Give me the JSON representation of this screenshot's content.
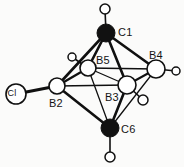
{
  "figure": {
    "kind": "molecular-structure-diagram",
    "background_color": "#fbfbfa",
    "line_color": "#101010",
    "cage_atom_fill": "#ffffff",
    "carbon_atom_fill": "#111111",
    "width": 184,
    "height": 167
  },
  "atoms": [
    {
      "id": "C1",
      "label": "C1",
      "element": "C",
      "style": "filled",
      "x": 106,
      "y": 33,
      "r": 9,
      "label_x": 118,
      "label_y": 27
    },
    {
      "id": "B4",
      "label": "B4",
      "element": "B",
      "style": "open",
      "x": 156,
      "y": 69,
      "r": 9,
      "label_x": 149,
      "label_y": 50
    },
    {
      "id": "B5",
      "label": "B5",
      "element": "B",
      "style": "open",
      "x": 88,
      "y": 68,
      "r": 8,
      "label_x": 96,
      "label_y": 55
    },
    {
      "id": "B2",
      "label": "B2",
      "element": "B",
      "style": "open",
      "x": 57,
      "y": 86,
      "r": 8,
      "label_x": 49,
      "label_y": 98
    },
    {
      "id": "B3",
      "label": "B3",
      "element": "B",
      "style": "open",
      "x": 127,
      "y": 85,
      "r": 9,
      "label_x": 105,
      "label_y": 92
    },
    {
      "id": "C6",
      "label": "C6",
      "element": "C",
      "style": "filled",
      "x": 110,
      "y": 128,
      "r": 9,
      "label_x": 121,
      "label_y": 124
    },
    {
      "id": "Cl",
      "label": "Cl",
      "element": "Cl",
      "style": "open-labeled",
      "x": 16,
      "y": 94,
      "r": 10,
      "label_x": 9,
      "label_y": 90
    }
  ],
  "hydrogens": [
    {
      "id": "H-C1",
      "attached_to": "C1",
      "x": 105,
      "y": 9,
      "r": 5
    },
    {
      "id": "H-B4",
      "attached_to": "B4",
      "x": 176,
      "y": 71,
      "r": 4
    },
    {
      "id": "H-B5",
      "attached_to": "B5",
      "x": 72,
      "y": 57,
      "r": 4
    },
    {
      "id": "H-B3",
      "attached_to": "B3",
      "x": 143,
      "y": 100,
      "r": 5
    },
    {
      "id": "H-C6",
      "attached_to": "C6",
      "x": 110,
      "y": 157,
      "r": 5
    }
  ],
  "bonds": [
    {
      "from": "C1",
      "to": "B5",
      "kind": "cage",
      "width": 2.6
    },
    {
      "from": "C1",
      "to": "B2",
      "kind": "cage",
      "width": 2.6
    },
    {
      "from": "C1",
      "to": "B3",
      "kind": "cage",
      "width": 2.6
    },
    {
      "from": "C1",
      "to": "B4",
      "kind": "cage",
      "width": 2.6
    },
    {
      "from": "B2",
      "to": "B5",
      "kind": "cage",
      "width": 2.4
    },
    {
      "from": "B5",
      "to": "B4",
      "kind": "cage",
      "width": 1.4
    },
    {
      "from": "B2",
      "to": "B3",
      "kind": "cage",
      "width": 1.4
    },
    {
      "from": "B5",
      "to": "B3",
      "kind": "cage",
      "width": 1.3
    },
    {
      "from": "B3",
      "to": "B4",
      "kind": "cage",
      "width": 2.0
    },
    {
      "from": "B2",
      "to": "C6",
      "kind": "cage",
      "width": 2.6
    },
    {
      "from": "B3",
      "to": "C6",
      "kind": "cage",
      "width": 2.6
    },
    {
      "from": "B5",
      "to": "C6",
      "kind": "cage",
      "width": 1.3
    },
    {
      "from": "B4",
      "to": "C6",
      "kind": "cage",
      "width": 1.3
    },
    {
      "from": "B2",
      "to": "Cl",
      "kind": "substituent",
      "width": 3.2
    }
  ],
  "hydrogen_bonds": [
    {
      "from": "C1",
      "to": "H-C1",
      "width": 1.6
    },
    {
      "from": "B4",
      "to": "H-B4",
      "width": 1.6
    },
    {
      "from": "B5",
      "to": "H-B5",
      "width": 1.6
    },
    {
      "from": "B3",
      "to": "H-B3",
      "width": 1.6
    },
    {
      "from": "C6",
      "to": "H-C6",
      "width": 1.6
    }
  ]
}
